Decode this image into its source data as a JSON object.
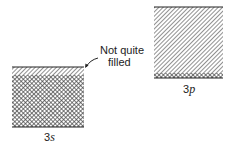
{
  "diagram": {
    "type": "energy-band-diagram",
    "bands": [
      {
        "id": "3s",
        "label_number": "3",
        "label_letter": "s",
        "state": "Not quite filled",
        "filled_fraction": 0.85
      },
      {
        "id": "3p",
        "label_number": "3",
        "label_letter": "p",
        "state": "mostly empty",
        "filled_fraction": 0.08
      }
    ],
    "annotation": {
      "line1": "Not quite",
      "line2": "filled",
      "points_to": "3s"
    },
    "colors": {
      "line": "#222222",
      "hatch": "#555555",
      "background": "#ffffff"
    }
  }
}
